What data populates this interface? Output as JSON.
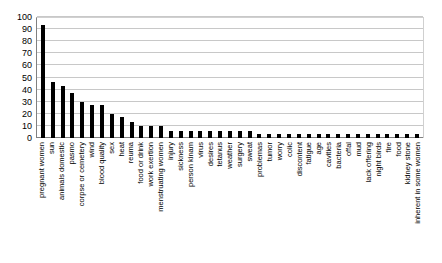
{
  "chart_data": {
    "type": "bar",
    "title": "",
    "subtitle": "",
    "xlabel": "",
    "ylabel": "",
    "ylim": [
      0,
      100
    ],
    "ytick_step": 10,
    "yticks": [
      0,
      10,
      20,
      30,
      40,
      50,
      60,
      70,
      80,
      90,
      100
    ],
    "grid": true,
    "legend": false,
    "legend_position": "none",
    "bar_color": "#000000",
    "background_color": "#ffffff",
    "gridline_color": "#c8c8c8",
    "axis_color": "#808080",
    "orientation": "vertical",
    "categories": [
      "pregnant women",
      "sun",
      "animals domestic",
      "pasmo",
      "corpse or cemetery",
      "wind",
      "blood quality",
      "sex",
      "heat",
      "reuma",
      "food or drink",
      "work exertion",
      "menstruating women",
      "injury",
      "sickness",
      "person kinam",
      "virus",
      "desires",
      "tetanus",
      "weather",
      "surgery",
      "sweat",
      "problemas",
      "tumor",
      "worry",
      "colic",
      "discontent",
      "fatigue",
      "age",
      "cavities",
      "bacteria",
      "offal",
      "mud",
      "lack offering",
      "night birds",
      "fire",
      "food",
      "kidney stone",
      "inherent in some women"
    ],
    "values": [
      93,
      46,
      43,
      37,
      30,
      27,
      27,
      20,
      17,
      13,
      10,
      10,
      10,
      6,
      6,
      6,
      6,
      6,
      6,
      6,
      6,
      6,
      3,
      3,
      3,
      3,
      3,
      3,
      3,
      3,
      3,
      3,
      3,
      3,
      3,
      3,
      3,
      3,
      3
    ]
  }
}
